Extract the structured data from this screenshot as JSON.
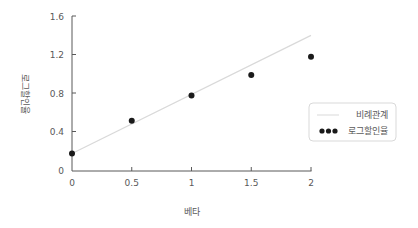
{
  "chart_data": {
    "type": "scatter",
    "title": "",
    "xlabel": "베타",
    "ylabel": "로그할인율",
    "xlim": [
      0,
      2
    ],
    "ylim": [
      0,
      1.6
    ],
    "x_ticks": [
      "0",
      "0.5",
      "1",
      "1.5",
      "2"
    ],
    "y_ticks": [
      "0",
      "0.4",
      "0.8",
      "1.2",
      "1.6"
    ],
    "grid": false,
    "legend_position": "right",
    "series": [
      {
        "name": "비례관계",
        "type": "line",
        "color": "#d9d9d9",
        "x": [
          0,
          2
        ],
        "y": [
          0.18,
          1.4
        ]
      },
      {
        "name": "로그할인율",
        "type": "scatter",
        "color": "#1a1a1a",
        "x": [
          0,
          0.5,
          1,
          1.5,
          2
        ],
        "y": [
          0.18,
          0.52,
          0.78,
          0.99,
          1.18
        ]
      }
    ]
  },
  "legend": {
    "items": [
      {
        "label": "비례관계"
      },
      {
        "label": "로그할인율"
      }
    ]
  }
}
